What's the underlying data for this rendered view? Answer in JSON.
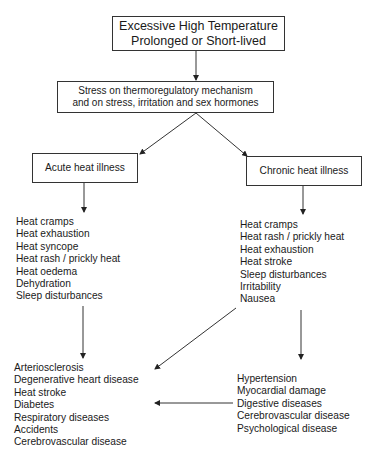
{
  "diagram": {
    "top_box": {
      "lines": [
        "Excessive High Temperature",
        "Prolonged or Short-lived"
      ]
    },
    "stress_box": {
      "lines": [
        "Stress on thermoregulatory mechanism",
        "and on stress, irritation and sex hormones"
      ]
    },
    "acute_box": {
      "label": "Acute heat illness"
    },
    "chronic_box": {
      "label": "Chronic heat illness"
    },
    "acute_symptoms": [
      "Heat cramps",
      "Heat exhaustion",
      "Heat syncope",
      "Heat rash / prickly heat",
      "Heat oedema",
      "Dehydration",
      "Sleep disturbances"
    ],
    "chronic_symptoms": [
      "Heat cramps",
      "Heat rash / prickly heat",
      "Heat exhaustion",
      "Heat stroke",
      "Sleep disturbances",
      "Irritability",
      "Nausea"
    ],
    "acute_outcomes": [
      "Arteriosclerosis",
      "Degenerative heart disease",
      "Heat stroke",
      "Diabetes",
      "Respiratory diseases",
      "Accidents",
      "Cerebrovascular disease"
    ],
    "chronic_outcomes": [
      "Hypertension",
      "Myocardial damage",
      "Digestive diseases",
      "Cerebrovascular disease",
      "Psychological disease"
    ]
  }
}
